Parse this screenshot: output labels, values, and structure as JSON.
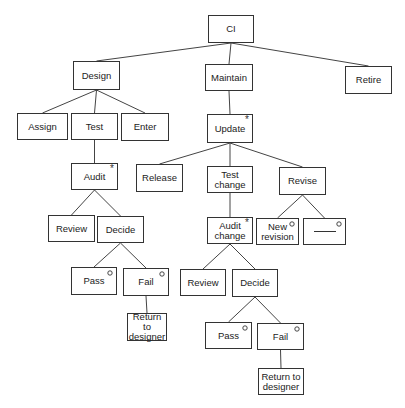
{
  "diagram": {
    "type": "tree",
    "legend": {
      "asterisk": "*",
      "circle": "°"
    },
    "nodes": [
      {
        "id": "ci",
        "label": "CI",
        "x": 208,
        "y": 15,
        "w": 46,
        "h": 28,
        "mark": ""
      },
      {
        "id": "design",
        "label": "Design",
        "x": 73,
        "y": 61,
        "w": 47,
        "h": 29,
        "mark": ""
      },
      {
        "id": "maintain",
        "label": "Maintain",
        "x": 205,
        "y": 64,
        "w": 48,
        "h": 27,
        "mark": ""
      },
      {
        "id": "retire",
        "label": "Retire",
        "x": 345,
        "y": 66,
        "w": 47,
        "h": 28,
        "mark": ""
      },
      {
        "id": "assign",
        "label": "Assign",
        "x": 17,
        "y": 113,
        "w": 51,
        "h": 27,
        "mark": ""
      },
      {
        "id": "test",
        "label": "Test",
        "x": 71,
        "y": 113,
        "w": 47,
        "h": 27,
        "mark": ""
      },
      {
        "id": "enter",
        "label": "Enter",
        "x": 121,
        "y": 113,
        "w": 48,
        "h": 28,
        "mark": ""
      },
      {
        "id": "update",
        "label": "Update",
        "x": 207,
        "y": 114,
        "w": 46,
        "h": 29,
        "mark": "*"
      },
      {
        "id": "audit",
        "label": "Audit",
        "x": 71,
        "y": 163,
        "w": 47,
        "h": 27,
        "mark": "*"
      },
      {
        "id": "release",
        "label": "Release",
        "x": 136,
        "y": 164,
        "w": 47,
        "h": 28,
        "mark": ""
      },
      {
        "id": "test-change",
        "label": "Test\nchange",
        "x": 207,
        "y": 166,
        "w": 46,
        "h": 27,
        "mark": ""
      },
      {
        "id": "revise",
        "label": "Revise",
        "x": 279,
        "y": 167,
        "w": 47,
        "h": 28,
        "mark": ""
      },
      {
        "id": "review-1",
        "label": "Review",
        "x": 48,
        "y": 215,
        "w": 47,
        "h": 27,
        "mark": ""
      },
      {
        "id": "decide-1",
        "label": "Decide",
        "x": 97,
        "y": 216,
        "w": 47,
        "h": 27,
        "mark": ""
      },
      {
        "id": "audit-change",
        "label": "Audit\nchange",
        "x": 207,
        "y": 217,
        "w": 46,
        "h": 27,
        "mark": "*"
      },
      {
        "id": "new-revision",
        "label": "New\nrevision",
        "x": 256,
        "y": 218,
        "w": 43,
        "h": 27,
        "mark": "o"
      },
      {
        "id": "blank",
        "label": "",
        "x": 303,
        "y": 218,
        "w": 43,
        "h": 27,
        "mark": "o",
        "blank": true
      },
      {
        "id": "pass-1",
        "label": "Pass",
        "x": 71,
        "y": 267,
        "w": 46,
        "h": 28,
        "mark": "o"
      },
      {
        "id": "fail-1",
        "label": "Fail",
        "x": 123,
        "y": 268,
        "w": 46,
        "h": 28,
        "mark": "o"
      },
      {
        "id": "review-2",
        "label": "Review",
        "x": 180,
        "y": 269,
        "w": 46,
        "h": 27,
        "mark": ""
      },
      {
        "id": "decide-2",
        "label": "Decide",
        "x": 232,
        "y": 269,
        "w": 46,
        "h": 28,
        "mark": ""
      },
      {
        "id": "return-1",
        "label": "Return to\ndesigner",
        "x": 127,
        "y": 313,
        "w": 40,
        "h": 28,
        "mark": ""
      },
      {
        "id": "pass-2",
        "label": "Pass",
        "x": 205,
        "y": 322,
        "w": 47,
        "h": 27,
        "mark": "o"
      },
      {
        "id": "fail-2",
        "label": "Fail",
        "x": 257,
        "y": 323,
        "w": 47,
        "h": 27,
        "mark": "o"
      },
      {
        "id": "return-2",
        "label": "Return to\ndesigner",
        "x": 258,
        "y": 368,
        "w": 46,
        "h": 27,
        "mark": ""
      }
    ],
    "edges": [
      [
        "ci",
        "design"
      ],
      [
        "ci",
        "maintain"
      ],
      [
        "ci",
        "retire"
      ],
      [
        "design",
        "assign"
      ],
      [
        "design",
        "test"
      ],
      [
        "design",
        "enter"
      ],
      [
        "test",
        "audit"
      ],
      [
        "audit",
        "review-1"
      ],
      [
        "audit",
        "decide-1"
      ],
      [
        "decide-1",
        "pass-1"
      ],
      [
        "decide-1",
        "fail-1"
      ],
      [
        "fail-1",
        "return-1"
      ],
      [
        "maintain",
        "update"
      ],
      [
        "update",
        "release"
      ],
      [
        "update",
        "test-change"
      ],
      [
        "update",
        "revise"
      ],
      [
        "test-change",
        "audit-change"
      ],
      [
        "revise",
        "new-revision"
      ],
      [
        "revise",
        "blank"
      ],
      [
        "audit-change",
        "review-2"
      ],
      [
        "audit-change",
        "decide-2"
      ],
      [
        "decide-2",
        "pass-2"
      ],
      [
        "decide-2",
        "fail-2"
      ],
      [
        "fail-2",
        "return-2"
      ]
    ]
  }
}
